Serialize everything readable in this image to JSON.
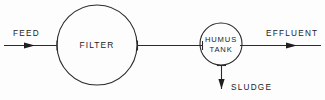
{
  "diagram": {
    "stroke_color": "#2b2b2b",
    "text_color": "#232323",
    "background_color": "#fdfdfd",
    "nodes": [
      {
        "id": "filter",
        "label": "FILTER",
        "shape": "circle",
        "cx": 97,
        "cy": 45,
        "r": 40
      },
      {
        "id": "humus-tank",
        "label_line1": "HUMUS",
        "label_line2": "TANK",
        "shape": "circle",
        "cx": 221,
        "cy": 44,
        "r": 21
      }
    ],
    "flows": [
      {
        "id": "feed",
        "label": "FEED",
        "direction": "right",
        "label_x": 13,
        "label_y": 33
      },
      {
        "id": "effluent",
        "label": "EFFLUENT",
        "direction": "right",
        "label_x": 266,
        "label_y": 33
      },
      {
        "id": "sludge",
        "label": "SLUDGE",
        "direction": "down",
        "label_x": 231,
        "label_y": 87
      }
    ]
  }
}
